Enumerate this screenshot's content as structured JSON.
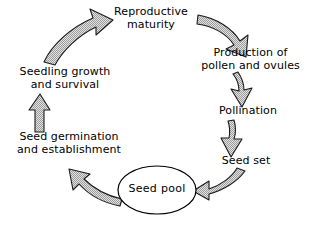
{
  "diagram": {
    "type": "cycle-diagram",
    "background_color": "#ffffff",
    "ink_color": "#000000",
    "arrow_fill_color": "#c9c9c9",
    "arrow_outline_color": "#1a1a1a",
    "arrow_fill_pattern": "stipple",
    "direction": "clockwise"
  },
  "nodes": {
    "reproductive_maturity": "Reproductive\nmaturity",
    "pollen_production": "Production of\npollen and ovules",
    "pollination": "Pollination",
    "seed_set": "Seed set",
    "seed_pool": "Seed pool",
    "seed_germination": "Seed germination\nand establishment",
    "seedling_growth": "Seedling growth\nand survival"
  },
  "arrows": [
    {
      "name": "arrow-maturity-to-pollen",
      "from": "reproductive_maturity",
      "to": "pollen_production",
      "shape": "curved",
      "direction": "right-down"
    },
    {
      "name": "arrow-pollen-to-pollination",
      "from": "pollen_production",
      "to": "pollination",
      "shape": "curved",
      "direction": "down"
    },
    {
      "name": "arrow-pollination-to-seed-set",
      "from": "pollination",
      "to": "seed_set",
      "shape": "tapered",
      "direction": "down"
    },
    {
      "name": "arrow-seed-set-to-seed-pool",
      "from": "seed_set",
      "to": "seed_pool",
      "shape": "curved",
      "direction": "left"
    },
    {
      "name": "arrow-seed-pool-to-germination",
      "from": "seed_pool",
      "to": "seed_germination",
      "shape": "curved",
      "direction": "left-up"
    },
    {
      "name": "arrow-germination-to-seedling",
      "from": "seed_germination",
      "to": "seedling_growth",
      "shape": "straight",
      "direction": "up"
    },
    {
      "name": "arrow-seedling-to-maturity",
      "from": "seedling_growth",
      "to": "reproductive_maturity",
      "shape": "curved",
      "direction": "up-right"
    }
  ]
}
